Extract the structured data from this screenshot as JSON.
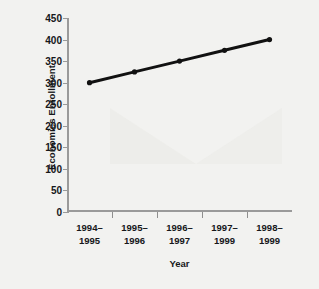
{
  "chart_data": {
    "type": "line",
    "title": "",
    "xlabel": "Year",
    "ylabel": "Economics Enrollment",
    "categories": [
      "1994–1995",
      "1995–1996",
      "1996–1997",
      "1997–1999",
      "1998–1999"
    ],
    "values": [
      300,
      325,
      350,
      375,
      400
    ],
    "ylim": [
      0,
      450
    ],
    "yticks": [
      0,
      50,
      100,
      150,
      200,
      250,
      300,
      350,
      400,
      450
    ],
    "ytick_labels": [
      "0",
      "50",
      "100",
      "150",
      "200",
      "250",
      "300",
      "350",
      "400",
      "450"
    ],
    "grid": false,
    "legend": false,
    "legend_position": "none",
    "series": [
      {
        "name": "Economics Enrollment",
        "values": [
          300,
          325,
          350,
          375,
          400
        ],
        "color": "#111111",
        "marker": "circle",
        "line_width": 3
      }
    ]
  },
  "style": {
    "background": "#f2f2f0",
    "plot_background": "#f7f7f5",
    "axis_color": "#9a9a9a",
    "text_color": "#16171a",
    "series_color": "#111111"
  }
}
